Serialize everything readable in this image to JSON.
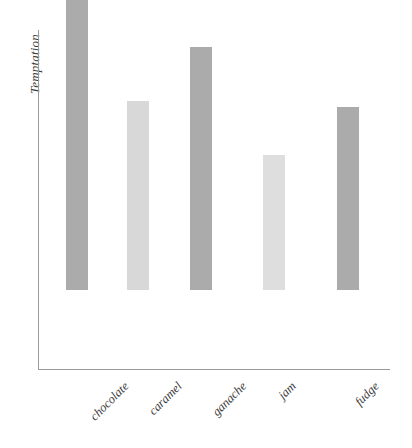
{
  "chart_data": {
    "type": "bar",
    "title": "",
    "subtitle": "",
    "xlabel": "",
    "ylabel": "Temptation",
    "categories": [
      "chocolate",
      "caramel",
      "ganache",
      "jam",
      "fudge"
    ],
    "values": [
      294,
      189,
      243,
      135,
      183
    ],
    "ylim": [
      0,
      339
    ],
    "grid": false,
    "legend": false,
    "legend_position": "none",
    "axis_color": "#9a9a9a",
    "background": "#ffffff",
    "bar_colors": [
      "#ababab",
      "#d8d8d8",
      "#ababab",
      "#dedede",
      "#ababab"
    ],
    "bars": [
      {
        "label": "chocolate",
        "value": 294,
        "color": "#ababab"
      },
      {
        "label": "caramel",
        "value": 189,
        "color": "#d8d8d8"
      },
      {
        "label": "ganache",
        "value": 243,
        "color": "#ababab"
      },
      {
        "label": "jam",
        "value": 135,
        "color": "#dedede"
      },
      {
        "label": "fudge",
        "value": 183,
        "color": "#ababab"
      }
    ],
    "tick_labels_x": [
      "chocolate",
      "caramel",
      "ganache",
      "jam",
      "fudge"
    ],
    "tick_labels_y": []
  },
  "layout": {
    "bar_x_positions": [
      66,
      127,
      190,
      263,
      337
    ],
    "bar_width": 22,
    "baseline_y": 369,
    "plot_top": 30,
    "axis_left": 38,
    "axis_right": 390
  }
}
